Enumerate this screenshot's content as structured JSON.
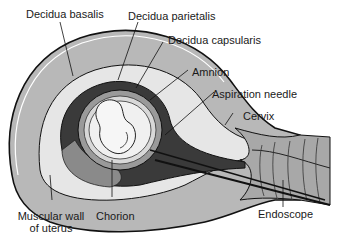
{
  "labels": {
    "decidua_basalis": "Decidua basalis",
    "decidua_parietalis": "Decidua parietalis",
    "decidua_capsularis": "Decidua capsularis",
    "amnion": "Amnion",
    "aspiration_needle": "Aspiration needle",
    "cervix": "Cervix",
    "muscular_wall_line1": "Muscular wall",
    "muscular_wall_line2": "of uterus",
    "chorion": "Chorion",
    "endoscope": "Endoscope"
  },
  "colors": {
    "muscle": "#b8b8b8",
    "decidua_light": "#e6e6e6",
    "chorion_dark": "#3a3a3a",
    "amnion_band": "#9a9a9a",
    "outline": "#111111",
    "background": "#ffffff"
  }
}
